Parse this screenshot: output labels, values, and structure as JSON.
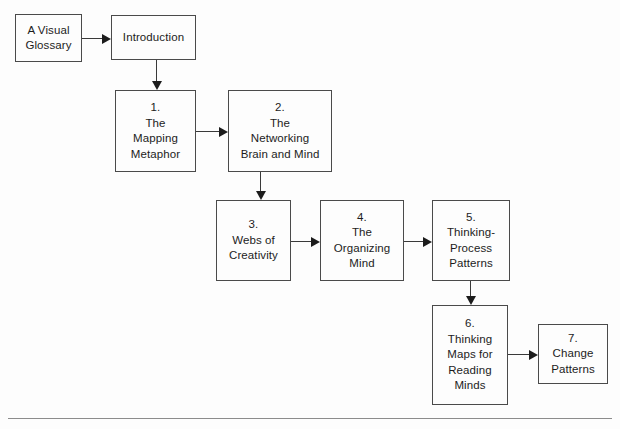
{
  "diagram": {
    "type": "flowchart",
    "nodes": [
      {
        "id": "glossary",
        "lines": [
          "A Visual",
          "Glossary"
        ],
        "x": 15,
        "y": 14,
        "w": 67,
        "h": 48
      },
      {
        "id": "introduction",
        "lines": [
          "Introduction"
        ],
        "x": 111,
        "y": 15,
        "w": 85,
        "h": 45
      },
      {
        "id": "ch1",
        "lines": [
          "1.",
          "The",
          "Mapping",
          "Metaphor"
        ],
        "x": 115,
        "y": 90,
        "w": 81,
        "h": 82
      },
      {
        "id": "ch2",
        "lines": [
          "2.",
          "The",
          "Networking",
          "Brain and Mind"
        ],
        "x": 228,
        "y": 90,
        "w": 104,
        "h": 82
      },
      {
        "id": "ch3",
        "lines": [
          "3.",
          "Webs of",
          "Creativity"
        ],
        "x": 216,
        "y": 200,
        "w": 75,
        "h": 81
      },
      {
        "id": "ch4",
        "lines": [
          "4.",
          "The",
          "Organizing",
          "Mind"
        ],
        "x": 320,
        "y": 200,
        "w": 84,
        "h": 81
      },
      {
        "id": "ch5",
        "lines": [
          "5.",
          "Thinking-",
          "Process",
          "Patterns"
        ],
        "x": 432,
        "y": 200,
        "w": 78,
        "h": 81
      },
      {
        "id": "ch6",
        "lines": [
          "6.",
          "Thinking",
          "Maps for",
          "Reading",
          "Minds"
        ],
        "x": 432,
        "y": 305,
        "w": 76,
        "h": 100
      },
      {
        "id": "ch7",
        "lines": [
          "7.",
          "Change",
          "Patterns"
        ],
        "x": 538,
        "y": 324,
        "w": 70,
        "h": 60
      }
    ],
    "edges": [
      {
        "id": "glossary-to-introduction",
        "from": "glossary",
        "to": "introduction",
        "direction": "right"
      },
      {
        "id": "introduction-to-ch1",
        "from": "introduction",
        "to": "ch1",
        "direction": "down"
      },
      {
        "id": "ch1-to-ch2",
        "from": "ch1",
        "to": "ch2",
        "direction": "right"
      },
      {
        "id": "ch2-to-ch3",
        "from": "ch2",
        "to": "ch3",
        "direction": "down"
      },
      {
        "id": "ch3-to-ch4",
        "from": "ch3",
        "to": "ch4",
        "direction": "right"
      },
      {
        "id": "ch4-to-ch5",
        "from": "ch4",
        "to": "ch5",
        "direction": "right"
      },
      {
        "id": "ch5-to-ch6",
        "from": "ch5",
        "to": "ch6",
        "direction": "down"
      },
      {
        "id": "ch6-to-ch7",
        "from": "ch6",
        "to": "ch7",
        "direction": "right"
      }
    ],
    "footer_rule": {
      "x": 8,
      "y": 418,
      "w": 604
    },
    "colors": {
      "background": "#fdfdfd",
      "node_border": "#4a4a4a",
      "node_text": "#1c1c1c",
      "edge": "#3a3a3a",
      "footer_rule": "#8c8c8c"
    }
  }
}
